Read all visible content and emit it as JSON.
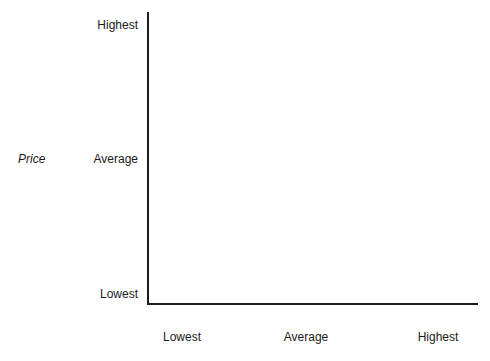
{
  "figure": {
    "background_color": "#ffffff",
    "line_color": "#1c1c1c",
    "text_color": "#1a1a1a"
  },
  "chart_data": {
    "type": "scatter",
    "title": "",
    "subtitle": "",
    "xlabel": "",
    "ylabel": "Price",
    "x_tick_labels": [
      "Lowest",
      "Average",
      "Highest"
    ],
    "y_tick_labels": [
      "Lowest",
      "Average",
      "Highest"
    ],
    "series": [],
    "values": [],
    "annotations": [],
    "legend": [],
    "legend_position": "none",
    "grid": false
  }
}
